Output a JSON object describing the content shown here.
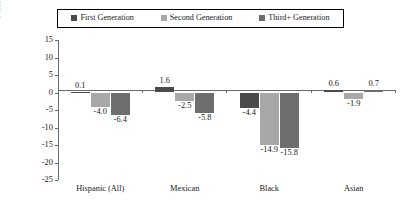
{
  "chart_data": {
    "type": "bar",
    "title": "",
    "xlabel": "",
    "ylabel": "Percentage Point Differential",
    "categories": [
      "Hispanic (All)",
      "Mexican",
      "Black",
      "Asian"
    ],
    "series": [
      {
        "name": "First Generation",
        "color": "#4a4a4a",
        "values": [
          0.1,
          1.6,
          -4.4,
          0.6
        ]
      },
      {
        "name": "Second Generation",
        "color": "#a8a8a8",
        "values": [
          -4.0,
          -2.5,
          -14.9,
          -1.9
        ]
      },
      {
        "name": "Third+ Generation",
        "color": "#6e6e6e",
        "values": [
          -6.4,
          -5.8,
          -15.8,
          0.7
        ]
      }
    ],
    "value_labels": [
      [
        "0.1",
        "-4.0",
        "-6.4"
      ],
      [
        "1.6",
        "-2.5",
        "-5.8"
      ],
      [
        "-4.4",
        "-14.9",
        "-15.8"
      ],
      [
        "0.6",
        "-1.9",
        "0.7"
      ]
    ],
    "ylim": [
      -25,
      15
    ],
    "ytick_step": 5,
    "ytick_labels": [
      "15",
      "10",
      "5",
      "0",
      "-5",
      "-10",
      "-15",
      "-20",
      "-25"
    ],
    "ytick_values": [
      15,
      10,
      5,
      0,
      -5,
      -10,
      -15,
      -20,
      -25
    ],
    "grid": false,
    "legend_position": "top"
  },
  "legend": {
    "items": [
      {
        "label": "First Generation",
        "color": "#4a4a4a"
      },
      {
        "label": "Second Generation",
        "color": "#a8a8a8"
      },
      {
        "label": "Third+ Generation",
        "color": "#6e6e6e"
      }
    ]
  }
}
